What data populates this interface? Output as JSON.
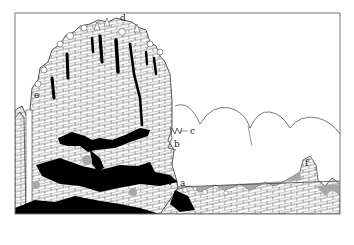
{
  "diagram": {
    "type": "geological cross-section",
    "colors": {
      "frame": "#777777",
      "outline": "#444444",
      "hatch": "#555555",
      "cavity": "#000000",
      "sediment": "#a8a8a8",
      "background": "#ffffff"
    },
    "labels": {
      "a": "a",
      "b": "b",
      "c": "c",
      "d": "d",
      "e": "e",
      "f": "f"
    }
  }
}
